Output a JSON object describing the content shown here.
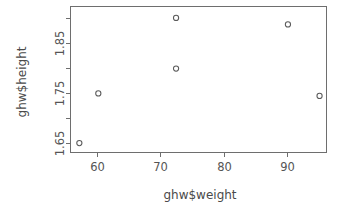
{
  "chart_data": {
    "type": "scatter",
    "title": "",
    "xlabel": "ghw$weight",
    "ylabel": "ghw$height",
    "x": [
      57.0,
      60.0,
      72.3,
      72.3,
      90.0,
      95.0
    ],
    "y": [
      1.65,
      1.75,
      1.902,
      1.8,
      1.889,
      1.745
    ],
    "points": [
      {
        "x": 57.0,
        "y": 1.65
      },
      {
        "x": 60.0,
        "y": 1.75
      },
      {
        "x": 72.3,
        "y": 1.902
      },
      {
        "x": 72.3,
        "y": 1.8
      },
      {
        "x": 90.0,
        "y": 1.889
      },
      {
        "x": 95.0,
        "y": 1.745
      }
    ],
    "xlim": [
      55.6,
      96.1
    ],
    "ylim": [
      1.631,
      1.925
    ],
    "xticks": [
      60,
      70,
      80,
      90
    ],
    "xtick_labels": [
      "60",
      "70",
      "80",
      "90"
    ],
    "yticks": [
      1.65,
      1.7,
      1.75,
      1.8,
      1.85,
      1.9
    ],
    "ytick_labels": [
      "1.65",
      "",
      "1.75",
      "",
      "1.85",
      ""
    ],
    "ytick_labeled": [
      1.65,
      1.75,
      1.85
    ],
    "ytick_labeled_text": [
      "1.65",
      "1.75",
      "1.85"
    ],
    "grid": false,
    "legend": null,
    "marker": "open-circle",
    "marker_color": "#5a5a5a",
    "axis_color": "#6e6e6e",
    "background": "#ffffff",
    "box": true
  },
  "axis": {
    "x_title": "ghw$weight",
    "y_title": "ghw$height"
  }
}
